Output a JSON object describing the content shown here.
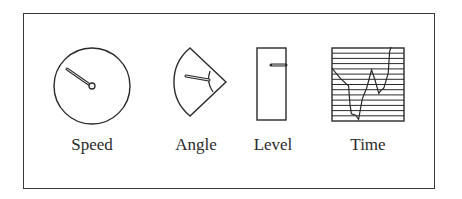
{
  "figure": {
    "stroke_color": "#2a2a2a",
    "background_color": "#ffffff"
  },
  "displays": [
    {
      "id": "speed",
      "label": "Speed",
      "type": "circular-dial",
      "needle_angle_deg": 145
    },
    {
      "id": "angle",
      "label": "Angle",
      "type": "sector-dial",
      "needle_angle_deg": 190
    },
    {
      "id": "level",
      "label": "Level",
      "type": "vertical-bar-gauge",
      "marker_position": "upper"
    },
    {
      "id": "time",
      "label": "Time",
      "type": "time-series-trace",
      "grid_lines": 14
    }
  ],
  "chart_data": {
    "type": "line",
    "title": "Time",
    "xlabel": "",
    "ylabel": "",
    "grid": "horizontal",
    "series": [
      {
        "name": "trace",
        "points": [
          [
            0,
            0.28
          ],
          [
            0.12,
            0.42
          ],
          [
            0.23,
            0.52
          ],
          [
            0.25,
            0.78
          ],
          [
            0.27,
            0.9
          ],
          [
            0.33,
            0.92
          ],
          [
            0.37,
            0.98
          ],
          [
            0.42,
            0.7
          ],
          [
            0.48,
            0.55
          ],
          [
            0.55,
            0.3
          ],
          [
            0.6,
            0.45
          ],
          [
            0.65,
            0.62
          ],
          [
            0.68,
            0.58
          ],
          [
            0.72,
            0.55
          ],
          [
            0.78,
            0.35
          ],
          [
            0.8,
            0.05
          ],
          [
            0.82,
            -0.05
          ]
        ]
      }
    ]
  }
}
